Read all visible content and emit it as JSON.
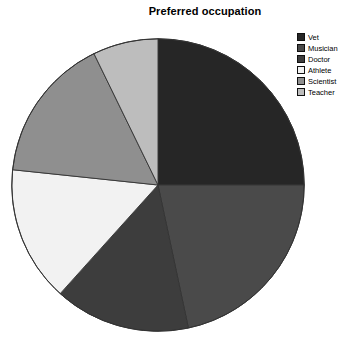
{
  "chart_data": {
    "type": "pie",
    "title": "Preferred occupation",
    "xlabel": "",
    "ylabel": "",
    "legend_position": "top-right",
    "grid": false,
    "start_angle_deg": 0,
    "direction": "clockwise",
    "categories": [
      "Vet",
      "Musician",
      "Doctor",
      "Athlete",
      "Scientist",
      "Teacher"
    ],
    "values": [
      25.0,
      21.7,
      15.0,
      15.0,
      16.1,
      7.2
    ],
    "slice_angles_deg": [
      90,
      78,
      54,
      54,
      58,
      26
    ],
    "colors": [
      "#262626",
      "#4a4a4a",
      "#3d3d3d",
      "#f2f2f2",
      "#8f8f8f",
      "#bdbdbd"
    ],
    "slices": [
      {
        "label": "Vet",
        "value": 25.0,
        "angle_deg": 90,
        "color": "#262626"
      },
      {
        "label": "Musician",
        "value": 21.7,
        "angle_deg": 78,
        "color": "#4a4a4a"
      },
      {
        "label": "Doctor",
        "value": 15.0,
        "angle_deg": 54,
        "color": "#3d3d3d"
      },
      {
        "label": "Athlete",
        "value": 15.0,
        "angle_deg": 54,
        "color": "#f2f2f2"
      },
      {
        "label": "Scientist",
        "value": 16.1,
        "angle_deg": 58,
        "color": "#8f8f8f"
      },
      {
        "label": "Teacher",
        "value": 7.2,
        "angle_deg": 26,
        "color": "#bdbdbd"
      }
    ]
  },
  "legend": {
    "items": [
      {
        "label": "Vet",
        "color": "#262626"
      },
      {
        "label": "Musician",
        "color": "#4a4a4a"
      },
      {
        "label": "Doctor",
        "color": "#3d3d3d"
      },
      {
        "label": "Athlete",
        "color": "#f2f2f2"
      },
      {
        "label": "Scientist",
        "color": "#8f8f8f"
      },
      {
        "label": "Teacher",
        "color": "#bdbdbd"
      }
    ]
  },
  "style": {
    "outline_color": "#333333",
    "background": "#ffffff"
  }
}
